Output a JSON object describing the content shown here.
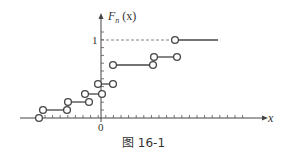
{
  "figure": {
    "caption": "图 16-1",
    "y_axis_label_main": "F",
    "y_axis_label_sub": "n",
    "y_axis_label_arg": "(x)",
    "x_axis_label": "x",
    "origin_label": "0",
    "y_tick_one_label": "1"
  },
  "colors": {
    "axis": "#444444",
    "step": "#444444",
    "dashed": "#666666",
    "background": "#ffffff"
  },
  "steps": [
    {
      "x1": 39,
      "x2": 39,
      "y": 118,
      "single": true
    },
    {
      "x1": 43,
      "x2": 67,
      "y": 110
    },
    {
      "x1": 68,
      "x2": 89,
      "y": 102
    },
    {
      "x1": 85,
      "x2": 102,
      "y": 94
    },
    {
      "x1": 98,
      "x2": 113,
      "y": 84
    },
    {
      "x1": 113,
      "x2": 153,
      "y": 65
    },
    {
      "x1": 154,
      "x2": 177,
      "y": 57
    },
    {
      "x1": 175,
      "x2": 218,
      "y": 40,
      "open_right": true
    }
  ]
}
